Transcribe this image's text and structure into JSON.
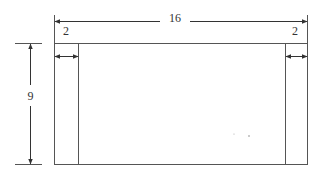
{
  "diagram": {
    "type": "dimensioned-rectangle",
    "line_color": "#444444",
    "labels": {
      "total_width": "16",
      "left_margin": "2",
      "right_margin": "2",
      "height": "9"
    },
    "dimensions": {
      "width": 16,
      "height": 9,
      "left_strip_width": 2,
      "right_strip_width": 2
    }
  }
}
